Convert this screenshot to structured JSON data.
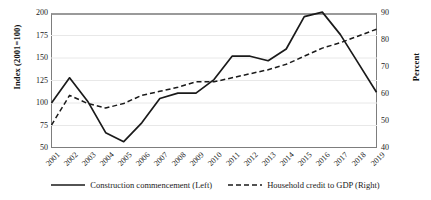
{
  "chart_data": {
    "type": "line",
    "title": "",
    "subtitle": "",
    "xlabel": "",
    "ylabel": "Index (2001=100)",
    "ylabel_right": "Percent",
    "grid": true,
    "legend_position": "bottom",
    "categories": [
      "2001",
      "2002",
      "2003",
      "2004",
      "2005",
      "2006",
      "2007",
      "2008",
      "2009",
      "2010",
      "2011",
      "2012",
      "2013",
      "2014",
      "2015",
      "2016",
      "2017",
      "2018",
      "2019"
    ],
    "ylim": [
      50,
      200
    ],
    "yticks": [
      "200",
      "175",
      "150",
      "125",
      "100",
      "75",
      "50"
    ],
    "ylim_right": [
      40,
      90
    ],
    "yticks_right": [
      "90",
      "80",
      "70",
      "60",
      "50",
      "40"
    ],
    "series": [
      {
        "name": "Construction commencement (Left)",
        "axis": "left",
        "style": "solid",
        "color": "#1a1a1a",
        "values": [
          100,
          128,
          102,
          67,
          57,
          78,
          105,
          111,
          111,
          126,
          152,
          152,
          147,
          160,
          196,
          201,
          176,
          144,
          112
        ]
      },
      {
        "name": "Household credit to GDP (Right)",
        "axis": "right",
        "style": "dashed",
        "color": "#1a1a1a",
        "values": [
          48.5,
          59.5,
          56.5,
          54.8,
          56.5,
          59.5,
          61.0,
          62.5,
          64.5,
          64.5,
          66.0,
          67.5,
          69.0,
          71.0,
          74.0,
          77.0,
          79.0,
          81.5,
          84.0
        ]
      }
    ]
  },
  "legend": {
    "items": [
      {
        "label": "Construction commencement (Left)",
        "style": "solid"
      },
      {
        "label": "Household credit to GDP (Right)",
        "style": "dashed"
      }
    ]
  }
}
